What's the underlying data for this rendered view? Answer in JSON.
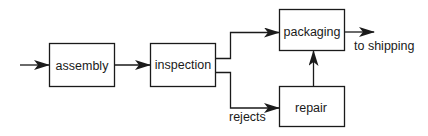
{
  "diagram": {
    "type": "flowchart",
    "nodes": [
      {
        "id": "assembly",
        "label": "assembly"
      },
      {
        "id": "inspection",
        "label": "inspection"
      },
      {
        "id": "packaging",
        "label": "packaging"
      },
      {
        "id": "repair",
        "label": "repair"
      }
    ],
    "edges": [
      {
        "from": "input",
        "to": "assembly",
        "label": ""
      },
      {
        "from": "assembly",
        "to": "inspection",
        "label": ""
      },
      {
        "from": "inspection",
        "to": "packaging",
        "label": ""
      },
      {
        "from": "inspection",
        "to": "repair",
        "label": "rejects"
      },
      {
        "from": "repair",
        "to": "packaging",
        "label": ""
      },
      {
        "from": "packaging",
        "to": "output",
        "label": "to shipping"
      }
    ],
    "labels": {
      "rejects": "rejects",
      "to_shipping": "to shipping"
    },
    "colors": {
      "stroke": "#1a1a1a",
      "background": "#ffffff"
    }
  }
}
